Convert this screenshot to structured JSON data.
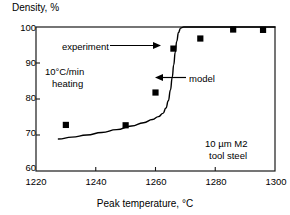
{
  "chart_data": {
    "type": "scatter",
    "title": "",
    "xlabel": "Peak temperature, °C",
    "ylabel": "Density, %",
    "xlim": [
      1220,
      1300
    ],
    "ylim": [
      60,
      100
    ],
    "xticks": [
      1220,
      1240,
      1260,
      1280,
      1300
    ],
    "yticks": [
      60,
      70,
      80,
      90,
      100
    ],
    "grid": false,
    "legend_position": "none",
    "series": [
      {
        "name": "experiment",
        "type": "scatter",
        "marker": "square",
        "color": "#000000",
        "points": [
          {
            "x": 1230,
            "y": 72.8
          },
          {
            "x": 1250,
            "y": 72.7
          },
          {
            "x": 1260,
            "y": 81.8
          },
          {
            "x": 1266,
            "y": 94.0
          },
          {
            "x": 1275,
            "y": 96.8
          },
          {
            "x": 1286,
            "y": 99.3
          },
          {
            "x": 1296,
            "y": 99.2
          }
        ]
      },
      {
        "name": "model",
        "type": "line",
        "color": "#000000",
        "points": [
          {
            "x": 1227.5,
            "y": 68.9
          },
          {
            "x": 1232,
            "y": 69.4
          },
          {
            "x": 1237,
            "y": 70.0
          },
          {
            "x": 1242,
            "y": 70.7
          },
          {
            "x": 1247,
            "y": 71.5
          },
          {
            "x": 1252,
            "y": 72.5
          },
          {
            "x": 1256,
            "y": 73.4
          },
          {
            "x": 1259,
            "y": 74.3
          },
          {
            "x": 1261,
            "y": 75.1
          },
          {
            "x": 1262.5,
            "y": 76.0
          },
          {
            "x": 1263.5,
            "y": 77.5
          },
          {
            "x": 1264.3,
            "y": 79.5
          },
          {
            "x": 1265.0,
            "y": 82.5
          },
          {
            "x": 1265.6,
            "y": 86.0
          },
          {
            "x": 1266.1,
            "y": 89.5
          },
          {
            "x": 1266.6,
            "y": 93.0
          },
          {
            "x": 1267.1,
            "y": 96.0
          },
          {
            "x": 1267.7,
            "y": 98.5
          },
          {
            "x": 1268.4,
            "y": 99.7
          },
          {
            "x": 1269.5,
            "y": 100.0
          },
          {
            "x": 1300,
            "y": 100.0
          }
        ]
      }
    ],
    "annotations": [
      {
        "name": "experiment-label",
        "text": "experiment",
        "x": 1238,
        "y": 94.0,
        "arrow": "right"
      },
      {
        "name": "model-label",
        "text": "model",
        "x": 1277,
        "y": 84.8,
        "arrow": "left"
      },
      {
        "name": "heating-rate-note",
        "text": "10°C/min\nheating",
        "line1": "10°C/min",
        "line2": "heating",
        "x": 1226,
        "y": 86.5
      },
      {
        "name": "material-note",
        "text": "10 µm M2\ntool steel",
        "line1": "10 µm M2",
        "line2": "tool steel",
        "x": 1276,
        "y": 66.5
      }
    ]
  },
  "axes": {
    "y_axis_title": "Density, %",
    "x_axis_title": "Peak temperature, °C",
    "y_tick_labels": [
      "100",
      "90",
      "80",
      "70",
      "60"
    ],
    "x_tick_labels": [
      "1220",
      "1240",
      "1260",
      "1280",
      "1300"
    ]
  },
  "annotations": {
    "experiment": "experiment",
    "model": "model",
    "heating_line1": "10°C/min",
    "heating_line2": "heating",
    "material_line1": "10 µm M2",
    "material_line2": "tool steel"
  },
  "colors": {
    "axis": "#1a1a1a",
    "marker": "#000000",
    "curve": "#000000",
    "background": "#ffffff"
  }
}
